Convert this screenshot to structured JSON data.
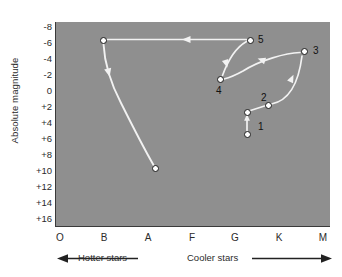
{
  "chart_data": {
    "type": "scatter",
    "title": "",
    "xlabel": "",
    "ylabel": "Absolute magnitude",
    "x_tick_labels": [
      "O",
      "B",
      "A",
      "F",
      "G",
      "K",
      "M"
    ],
    "x_tick_px": [
      60,
      104,
      148,
      192,
      235,
      279,
      323
    ],
    "y_tick_labels": [
      "-8",
      "-6",
      "-4",
      "-2",
      "0",
      "+2",
      "+4",
      "+6",
      "+8",
      "+10",
      "+12",
      "+14",
      "+16"
    ],
    "y_tick_values": [
      -8,
      -6,
      -4,
      -2,
      0,
      2,
      4,
      6,
      8,
      10,
      12,
      14,
      16
    ],
    "y_tick_px": [
      27,
      43,
      59,
      75,
      91,
      107,
      123,
      139,
      155,
      171,
      187,
      203,
      219
    ],
    "ylim": [
      -8,
      16
    ],
    "grid": false,
    "legend": "none",
    "plot_background": "#8f8f8f",
    "track_color": "#f2f2f2",
    "point_fill": "#ffffff",
    "point_stroke": "#1c1c1c",
    "points": [
      {
        "label": "",
        "spectral_class": "B",
        "magnitude": -6.0,
        "px": 103,
        "py": 40
      },
      {
        "label": "",
        "spectral_class": "A",
        "magnitude": 9.5,
        "px": 155,
        "py": 168
      },
      {
        "label": "5",
        "spectral_class": "G",
        "magnitude": -6.0,
        "px": 250,
        "py": 40
      },
      {
        "label": "4",
        "spectral_class": "G",
        "magnitude": -1.0,
        "px": 220,
        "py": 79
      },
      {
        "label": "3",
        "spectral_class": "K",
        "magnitude": -3.3,
        "px": 304,
        "py": 51
      },
      {
        "label": "2",
        "spectral_class": "K",
        "magnitude": 2.0,
        "px": 268,
        "py": 105
      },
      {
        "label": "",
        "spectral_class": "G",
        "magnitude": 2.7,
        "px": 247,
        "py": 112
      },
      {
        "label": "1",
        "spectral_class": "G",
        "magnitude": 5.6,
        "px": 247,
        "py": 134
      }
    ],
    "point_label_offsets": [
      {
        "label": "5",
        "x": 258,
        "y": 35
      },
      {
        "label": "4",
        "x": 216,
        "y": 86
      },
      {
        "label": "3",
        "x": 313,
        "y": 46
      },
      {
        "label": "2",
        "x": 261,
        "y": 93
      },
      {
        "label": "1",
        "x": 258,
        "y": 122
      }
    ],
    "evolution_tracks": [
      {
        "from": "1",
        "to": "2",
        "note": "main sequence to subgiant"
      },
      {
        "from": "2",
        "to": "3",
        "note": "subgiant to red giant"
      },
      {
        "from": "3",
        "to": "4",
        "note": "red giant to horizontal branch"
      },
      {
        "from": "4",
        "to": "5",
        "note": "horizontal branch to supergiant"
      },
      {
        "from": "5",
        "to": "B-star",
        "note": "supergiant bluewards"
      },
      {
        "from": "B-star",
        "to": "A-star",
        "note": "descent to white dwarf"
      }
    ]
  },
  "axes": {
    "y_title": "Absolute magnitude",
    "direction_left_label": "Hotter stars",
    "direction_right_label": "Cooler stars"
  }
}
